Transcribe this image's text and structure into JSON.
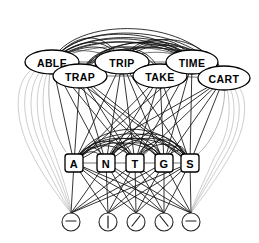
{
  "diagram": {
    "type": "layered-network",
    "background_color": "#ffffff",
    "ink_color": "#111111",
    "faint_edge_color": "#b8b8b8",
    "layers": [
      {
        "name": "word-layer",
        "label": "Word level",
        "node_shape": "ellipse",
        "nodes": [
          {
            "id": "w-able",
            "label": "ABLE",
            "cx": 52,
            "cy": 62,
            "rx": 27,
            "ry": 12
          },
          {
            "id": "w-trap",
            "label": "TRAP",
            "cx": 80,
            "cy": 76,
            "rx": 27,
            "ry": 12
          },
          {
            "id": "w-trip",
            "label": "TRIP",
            "cx": 122,
            "cy": 62,
            "rx": 27,
            "ry": 12
          },
          {
            "id": "w-take",
            "label": "TAKE",
            "cx": 160,
            "cy": 76,
            "rx": 27,
            "ry": 12
          },
          {
            "id": "w-time",
            "label": "TIME",
            "cx": 192,
            "cy": 62,
            "rx": 26,
            "ry": 12
          },
          {
            "id": "w-cart",
            "label": "CART",
            "cx": 224,
            "cy": 78,
            "rx": 26,
            "ry": 12
          }
        ]
      },
      {
        "name": "letter-layer",
        "label": "Letter level",
        "node_shape": "rounded-rect",
        "nodes": [
          {
            "id": "l-a",
            "label": "A",
            "cx": 74,
            "cy": 163,
            "rx": 9,
            "ry": 9
          },
          {
            "id": "l-n",
            "label": "N",
            "cx": 106,
            "cy": 163,
            "rx": 9,
            "ry": 9
          },
          {
            "id": "l-t",
            "label": "T",
            "cx": 135,
            "cy": 163,
            "rx": 9,
            "ry": 9
          },
          {
            "id": "l-g",
            "label": "G",
            "cx": 164,
            "cy": 163,
            "rx": 9,
            "ry": 9
          },
          {
            "id": "l-s",
            "label": "S",
            "cx": 190,
            "cy": 163,
            "rx": 9,
            "ry": 9
          }
        ]
      },
      {
        "name": "feature-layer",
        "label": "Feature level",
        "node_shape": "circle",
        "nodes": [
          {
            "id": "f-1",
            "label": "",
            "mark": "horizontal-bar",
            "cx": 71,
            "cy": 222,
            "r": 9
          },
          {
            "id": "f-2",
            "label": "",
            "mark": "vertical-bar",
            "cx": 108,
            "cy": 222,
            "r": 9
          },
          {
            "id": "f-3",
            "label": "",
            "mark": "forward-slash",
            "cx": 136,
            "cy": 222,
            "r": 9
          },
          {
            "id": "f-4",
            "label": "",
            "mark": "back-slash",
            "cx": 164,
            "cy": 222,
            "r": 9
          },
          {
            "id": "f-5",
            "label": "",
            "mark": "horizontal-bar",
            "cx": 191,
            "cy": 222,
            "r": 9
          }
        ]
      }
    ]
  }
}
